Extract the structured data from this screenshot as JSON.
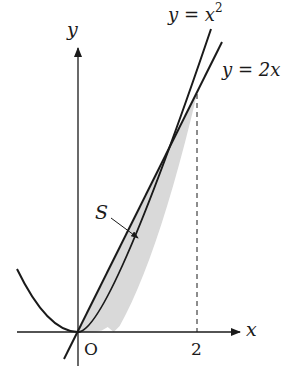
{
  "figure": {
    "curves": [
      {
        "name": "parabola",
        "equation_label": "y = x²",
        "lhs": "y",
        "eq": "=",
        "rhs_base": "x",
        "rhs_exp": "2"
      },
      {
        "name": "line",
        "equation_label": "y = 2x",
        "lhs": "y",
        "eq": "=",
        "rhs": "2x"
      }
    ],
    "axes": {
      "x_label": "x",
      "y_label": "y",
      "origin_label": "O",
      "x_tick_label": "2"
    },
    "region": {
      "label": "S",
      "fill_color": "#d9d9d9",
      "description": "region between y = 2x and y = x² for 0 ≤ x ≤ 2"
    },
    "colors": {
      "stroke": "#1a1a1a",
      "fill": "#d9d9d9"
    }
  }
}
